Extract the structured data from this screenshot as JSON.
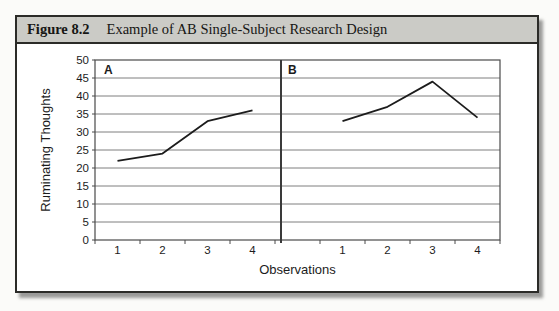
{
  "figure": {
    "label": "Figure 8.2",
    "title": "Example of AB Single-Subject Research Design"
  },
  "chart_data": {
    "type": "line",
    "title": "Example of AB Single-Subject Research Design",
    "xlabel": "Observations",
    "ylabel": "Ruminating Thoughts",
    "ylim": [
      0,
      50
    ],
    "ytick_step": 5,
    "yticks_top_to_bottom": [
      "50",
      "45",
      "40",
      "35",
      "30",
      "25",
      "20",
      "15",
      "10",
      "5",
      "0"
    ],
    "grid": "horizontal-only",
    "legend": "none",
    "colors": {
      "line": "#1c1c1c",
      "grid": "#7f7f7f",
      "plot_border": "#4a4a4a",
      "phase_divider": "#3a3a3a"
    },
    "panels": [
      {
        "label": "A",
        "categories": [
          "1",
          "2",
          "3",
          "4"
        ],
        "values": [
          22,
          24,
          33,
          36
        ]
      },
      {
        "label": "B",
        "categories": [
          "1",
          "2",
          "3",
          "4"
        ],
        "values": [
          33,
          37,
          44,
          34
        ]
      }
    ]
  }
}
